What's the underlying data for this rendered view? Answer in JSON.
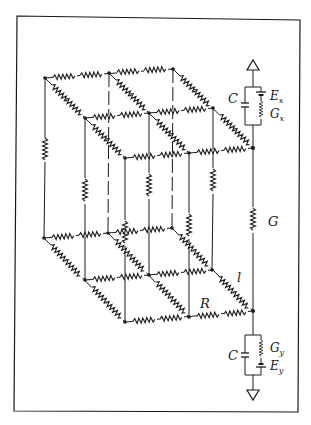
{
  "diagram": {
    "type": "3D resistor network (2x2 cell grid, top and bottom faces) with source branches",
    "labels": {
      "capacitor_top": "C",
      "emf_top": "E",
      "emf_top_sub": "x",
      "conductance_top": "G",
      "conductance_top_sub": "x",
      "capacitor_bottom": "C",
      "conductance_bottom": "G",
      "conductance_bottom_sub": "y",
      "emf_bottom": "E",
      "emf_bottom_sub": "y",
      "vertical_conductance": "G",
      "lateral_length": "l",
      "resistance": "R"
    },
    "colors": {
      "ink": "#1a1a1a",
      "background": "#ffffff"
    }
  }
}
